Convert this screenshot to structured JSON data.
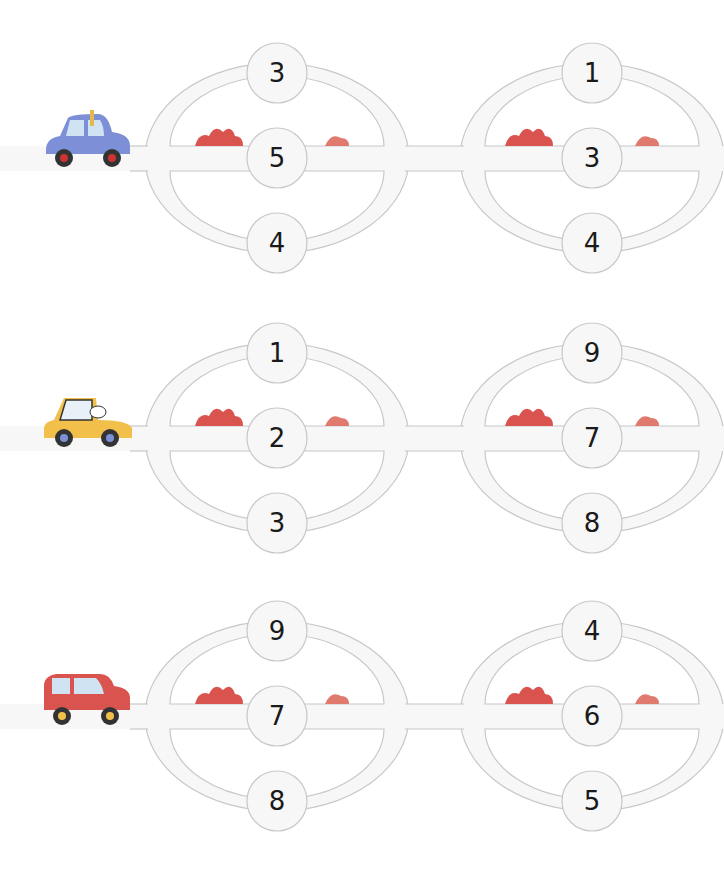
{
  "colors": {
    "road_fill": "#f7f7f7",
    "road_stroke": "#c8c8c8",
    "number_color": "#1a1a1a",
    "bush_dark": "#d9534f",
    "bush_light": "#e88a7f"
  },
  "puzzles": [
    {
      "car": {
        "name": "giraffe-car",
        "color": "#7d8fd6",
        "driver": "giraffe"
      },
      "loops": [
        {
          "top": "3",
          "middle": "5",
          "bottom": "4"
        },
        {
          "top": "1",
          "middle": "3",
          "bottom": "4"
        }
      ]
    },
    {
      "car": {
        "name": "dog-car",
        "color": "#f2c04a",
        "driver": "dog"
      },
      "loops": [
        {
          "top": "1",
          "middle": "2",
          "bottom": "3"
        },
        {
          "top": "9",
          "middle": "7",
          "bottom": "8"
        }
      ]
    },
    {
      "car": {
        "name": "monkey-car",
        "color": "#d9534f",
        "driver": "monkey and crocodile"
      },
      "loops": [
        {
          "top": "9",
          "middle": "7",
          "bottom": "8"
        },
        {
          "top": "4",
          "middle": "6",
          "bottom": "5"
        }
      ]
    }
  ]
}
